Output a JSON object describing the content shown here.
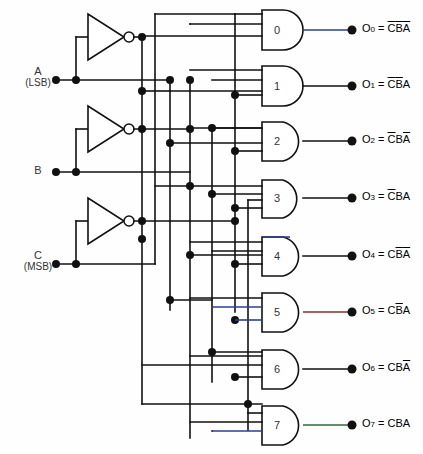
{
  "diagram": {
    "type": "logic-circuit"
  },
  "inputs": [
    {
      "id": "A",
      "name": "A",
      "sub": "(LSB)",
      "y": 80
    },
    {
      "id": "B",
      "name": "B",
      "sub": "",
      "y": 172
    },
    {
      "id": "C",
      "name": "C",
      "sub": "(MSB)",
      "y": 264
    }
  ],
  "inverters": [
    {
      "id": "notA",
      "for": "A",
      "label": "NOT"
    },
    {
      "id": "notB",
      "for": "B",
      "label": "NOT"
    },
    {
      "id": "notC",
      "for": "C",
      "label": "NOT"
    }
  ],
  "gates": [
    {
      "num": "0",
      "y": 30,
      "wire_color": "#2b3f8f"
    },
    {
      "num": "1",
      "y": 86,
      "wire_color": "#111111"
    },
    {
      "num": "2",
      "y": 141,
      "wire_color": "#111111"
    },
    {
      "num": "3",
      "y": 198,
      "wire_color": "#111111"
    },
    {
      "num": "4",
      "y": 256,
      "wire_color": "#111111"
    },
    {
      "num": "5",
      "y": 312,
      "wire_color": "#8f2b2b"
    },
    {
      "num": "6",
      "y": 369,
      "wire_color": "#111111"
    },
    {
      "num": "7",
      "y": 425,
      "wire_color": "#2b6b3a"
    }
  ],
  "outputs": [
    {
      "name": "O",
      "index": "0",
      "eq": "=",
      "c": "C",
      "c_bar": true,
      "b": "B",
      "b_bar": true,
      "a": "A",
      "a_bar": true,
      "text": "O0 = C'B'A'"
    },
    {
      "name": "O",
      "index": "1",
      "eq": "=",
      "c": "C",
      "c_bar": true,
      "b": "B",
      "b_bar": true,
      "a": "A",
      "a_bar": false,
      "text": "O1 = C'B'A"
    },
    {
      "name": "O",
      "index": "2",
      "eq": "=",
      "c": "C",
      "c_bar": true,
      "b": "B",
      "b_bar": false,
      "a": "A",
      "a_bar": true,
      "text": "O2 = C'BA'"
    },
    {
      "name": "O",
      "index": "3",
      "eq": "=",
      "c": "C",
      "c_bar": true,
      "b": "B",
      "b_bar": false,
      "a": "A",
      "a_bar": false,
      "text": "O3 = C'BA"
    },
    {
      "name": "O",
      "index": "4",
      "eq": "=",
      "c": "C",
      "c_bar": false,
      "b": "B",
      "b_bar": true,
      "a": "A",
      "a_bar": true,
      "text": "O4 = CB'A'"
    },
    {
      "name": "O",
      "index": "5",
      "eq": "=",
      "c": "C",
      "c_bar": false,
      "b": "B",
      "b_bar": true,
      "a": "A",
      "a_bar": false,
      "text": "O5 = CB'A"
    },
    {
      "name": "O",
      "index": "6",
      "eq": "=",
      "c": "C",
      "c_bar": false,
      "b": "B",
      "b_bar": false,
      "a": "A",
      "a_bar": true,
      "text": "O6 = CBA'"
    },
    {
      "name": "O",
      "index": "7",
      "eq": "=",
      "c": "C",
      "c_bar": false,
      "b": "B",
      "b_bar": false,
      "a": "A",
      "a_bar": false,
      "text": "O7 = CBA"
    }
  ],
  "colors": {
    "wire": "#111111",
    "background": "#fefefe",
    "gate_fill": "#ffffff",
    "accent_blue": "#2b3f8f",
    "accent_red": "#8f2b2b",
    "accent_green": "#2b6b3a"
  }
}
